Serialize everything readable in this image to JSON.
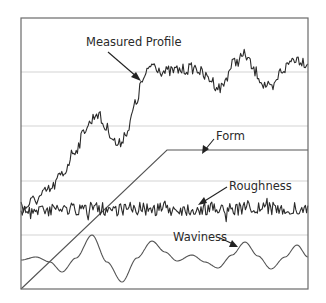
{
  "diagram": {
    "labels": {
      "measured_profile": "Measured Profile",
      "form": "Form",
      "roughness": "Roughness",
      "waviness": "Waviness"
    },
    "colors": {
      "background": "#ffffff",
      "frame": "#6a6a6a",
      "gridline": "#c8c8c8",
      "profile": "#2b2b2b",
      "form": "#555555",
      "waviness": "#555555"
    },
    "frame": {
      "x": 21,
      "y": 18,
      "width": 287,
      "height": 271
    },
    "gridlines_y": [
      72,
      126,
      181,
      235
    ],
    "components": [
      {
        "name": "Measured Profile",
        "shape": "noisy, rising step then plateau"
      },
      {
        "name": "Form",
        "shape": "linear ramp then flat plateau"
      },
      {
        "name": "Roughness",
        "shape": "high-frequency noise about a constant level"
      },
      {
        "name": "Waviness",
        "shape": "low-frequency smooth oscillation"
      }
    ]
  }
}
